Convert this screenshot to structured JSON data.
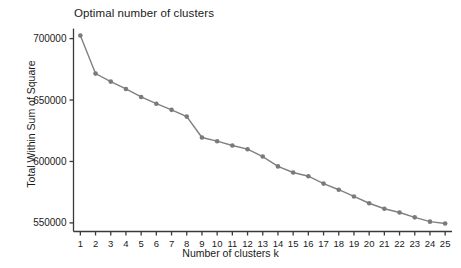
{
  "chart_data": {
    "type": "line",
    "title": "Optimal number of clusters",
    "xlabel": "Number of clusters k",
    "ylabel": "Total Within Sum of Square",
    "x": [
      1,
      2,
      3,
      4,
      5,
      6,
      7,
      8,
      9,
      10,
      11,
      12,
      13,
      14,
      15,
      16,
      17,
      18,
      19,
      20,
      21,
      22,
      23,
      24,
      25
    ],
    "categories": [
      "1",
      "2",
      "3",
      "4",
      "5",
      "6",
      "7",
      "8",
      "9",
      "10",
      "11",
      "12",
      "13",
      "14",
      "15",
      "16",
      "17",
      "18",
      "19",
      "20",
      "21",
      "22",
      "23",
      "24",
      "25"
    ],
    "values": [
      702500,
      671500,
      665000,
      659000,
      652500,
      647000,
      642000,
      636500,
      619500,
      616500,
      613000,
      610000,
      604000,
      596000,
      591000,
      588000,
      582000,
      577000,
      571500,
      566000,
      561500,
      558500,
      554500,
      551000,
      549500
    ],
    "xtick_labels": [
      "1",
      "2",
      "3",
      "4",
      "5",
      "6",
      "7",
      "8",
      "9",
      "10",
      "11",
      "12",
      "13",
      "14",
      "15",
      "16",
      "17",
      "18",
      "19",
      "20",
      "21",
      "22",
      "23",
      "24",
      "25"
    ],
    "ytick_labels": [
      "550000",
      "600000",
      "650000",
      "700000"
    ],
    "ytick_values": [
      550000,
      600000,
      650000,
      700000
    ],
    "ylim": [
      543000,
      707000
    ],
    "xlim": [
      0.55,
      25.45
    ],
    "grid": false,
    "legend": false,
    "series": [
      {
        "name": "Total Within Sum of Square",
        "values": [
          702500,
          671500,
          665000,
          659000,
          652500,
          647000,
          642000,
          636500,
          619500,
          616500,
          613000,
          610000,
          604000,
          596000,
          591000,
          588000,
          582000,
          577000,
          571500,
          566000,
          561500,
          558500,
          554500,
          551000,
          549500
        ],
        "color": "#808080",
        "marker": "circle"
      }
    ],
    "colors": {
      "line": "#808080",
      "marker": "#7a7a7a",
      "axis": "#3a3a3a",
      "text": "#1a1a1a",
      "background": "#ffffff"
    }
  }
}
